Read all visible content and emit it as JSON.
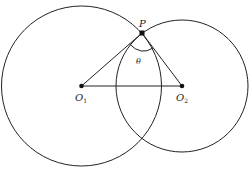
{
  "diagram": {
    "type": "two intersecting circles",
    "stroke_color": "#222222",
    "background": "#ffffff",
    "circle1": {
      "center_label": "O",
      "center_subscript": "1",
      "cx": 81.5,
      "cy": 86,
      "r": 80
    },
    "circle2": {
      "center_label": "O",
      "center_subscript": "2",
      "cx": 182,
      "cy": 86,
      "r": 66
    },
    "intersection_point": {
      "label": "P",
      "x": 142,
      "y": 33
    },
    "angle": {
      "label": "θ",
      "at": "P",
      "between": [
        "PO1",
        "PO2"
      ]
    },
    "segments": [
      "O1O2",
      "PO1",
      "PO2"
    ]
  }
}
